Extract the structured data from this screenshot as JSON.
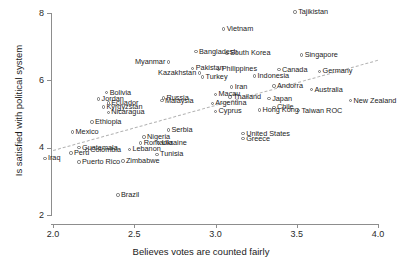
{
  "chart_data": {
    "type": "scatter",
    "title": "",
    "xlabel": "Believes votes are counted fairly",
    "ylabel": "Is satisfied with political system",
    "xlim": [
      2.0,
      4.0
    ],
    "ylim": [
      2.0,
      8.0
    ],
    "xticks": [
      "2.0",
      "2.5",
      "3.0",
      "3.5",
      "4.0"
    ],
    "xtick_values": [
      2.0,
      2.5,
      3.0,
      3.5,
      4.0
    ],
    "yticks": [
      "2",
      "4",
      "6",
      "8"
    ],
    "ytick_values": [
      2,
      4,
      6,
      8
    ],
    "grid": false,
    "legend": "none",
    "fit_line": {
      "style": "dashed",
      "x0": 2.0,
      "y0": 3.92,
      "x1": 4.0,
      "y1": 6.6
    },
    "points": [
      {
        "name": "Tajikistan",
        "x": 3.49,
        "y": 8.03,
        "side": "right"
      },
      {
        "name": "Vietnam",
        "x": 3.05,
        "y": 7.52,
        "side": "right"
      },
      {
        "name": "Bangladesh",
        "x": 2.88,
        "y": 6.85,
        "side": "right"
      },
      {
        "name": "South Korea",
        "x": 3.07,
        "y": 6.8,
        "side": "right"
      },
      {
        "name": "Singapore",
        "x": 3.53,
        "y": 6.75,
        "side": "right"
      },
      {
        "name": "Myanmar",
        "x": 2.71,
        "y": 6.55,
        "side": "left"
      },
      {
        "name": "Pakistan",
        "x": 2.86,
        "y": 6.36,
        "side": "right"
      },
      {
        "name": "Philippines",
        "x": 3.02,
        "y": 6.33,
        "side": "right"
      },
      {
        "name": "Canada",
        "x": 3.39,
        "y": 6.32,
        "side": "right"
      },
      {
        "name": "Germany",
        "x": 3.64,
        "y": 6.27,
        "side": "right"
      },
      {
        "name": "Kazakhstan",
        "x": 2.9,
        "y": 6.22,
        "side": "left"
      },
      {
        "name": "Turkey",
        "x": 2.92,
        "y": 6.1,
        "side": "right"
      },
      {
        "name": "Indonesia",
        "x": 3.24,
        "y": 6.13,
        "side": "right"
      },
      {
        "name": "Andorra",
        "x": 3.36,
        "y": 5.83,
        "side": "right"
      },
      {
        "name": "Iran",
        "x": 3.1,
        "y": 5.8,
        "side": "right"
      },
      {
        "name": "Bolivia",
        "x": 2.33,
        "y": 5.63,
        "side": "right"
      },
      {
        "name": "Macau",
        "x": 3.0,
        "y": 5.58,
        "side": "right"
      },
      {
        "name": "Australia",
        "x": 3.59,
        "y": 5.72,
        "side": "right"
      },
      {
        "name": "Russia",
        "x": 2.68,
        "y": 5.48,
        "side": "right"
      },
      {
        "name": "Thailand",
        "x": 3.09,
        "y": 5.5,
        "side": "right"
      },
      {
        "name": "Jordan",
        "x": 2.28,
        "y": 5.44,
        "side": "right"
      },
      {
        "name": "Japan",
        "x": 3.33,
        "y": 5.46,
        "side": "right"
      },
      {
        "name": "Malaysia",
        "x": 2.67,
        "y": 5.4,
        "side": "right"
      },
      {
        "name": "Ecuador",
        "x": 2.34,
        "y": 5.33,
        "side": "right"
      },
      {
        "name": "New Zealand",
        "x": 3.83,
        "y": 5.4,
        "side": "right"
      },
      {
        "name": "Argentina",
        "x": 2.98,
        "y": 5.32,
        "side": "right"
      },
      {
        "name": "Kyrgyzstan",
        "x": 2.31,
        "y": 5.21,
        "side": "right"
      },
      {
        "name": "Chile",
        "x": 3.36,
        "y": 5.2,
        "side": "right"
      },
      {
        "name": "Nicaragua",
        "x": 2.34,
        "y": 5.05,
        "side": "right"
      },
      {
        "name": "Cyprus",
        "x": 3.0,
        "y": 5.08,
        "side": "right"
      },
      {
        "name": "Hong Kong",
        "x": 3.27,
        "y": 5.12,
        "side": "right"
      },
      {
        "name": "Taiwan ROC",
        "x": 3.51,
        "y": 5.1,
        "side": "right"
      },
      {
        "name": "Ethiopia",
        "x": 2.24,
        "y": 4.76,
        "side": "right"
      },
      {
        "name": "Serbia",
        "x": 2.71,
        "y": 4.52,
        "side": "right"
      },
      {
        "name": "Mexico",
        "x": 2.12,
        "y": 4.47,
        "side": "right"
      },
      {
        "name": "United States",
        "x": 3.17,
        "y": 4.42,
        "side": "right"
      },
      {
        "name": "Nigeria",
        "x": 2.56,
        "y": 4.32,
        "side": "right"
      },
      {
        "name": "Greece",
        "x": 3.17,
        "y": 4.27,
        "side": "right"
      },
      {
        "name": "Romania",
        "x": 2.54,
        "y": 4.14,
        "side": "right"
      },
      {
        "name": "Ukraine",
        "x": 2.65,
        "y": 4.14,
        "side": "right"
      },
      {
        "name": "Guatemala",
        "x": 2.16,
        "y": 4.0,
        "side": "right"
      },
      {
        "name": "Colombia",
        "x": 2.21,
        "y": 3.93,
        "side": "right"
      },
      {
        "name": "Lebanon",
        "x": 2.47,
        "y": 3.95,
        "side": "right"
      },
      {
        "name": "Peru",
        "x": 2.11,
        "y": 3.84,
        "side": "right"
      },
      {
        "name": "Tunisia",
        "x": 2.64,
        "y": 3.8,
        "side": "right"
      },
      {
        "name": "Iraq",
        "x": 1.95,
        "y": 3.68,
        "side": "right"
      },
      {
        "name": "Puerto Rico",
        "x": 2.16,
        "y": 3.58,
        "side": "right"
      },
      {
        "name": "Zimbabwe",
        "x": 2.43,
        "y": 3.6,
        "side": "right"
      },
      {
        "name": "Brazil",
        "x": 2.4,
        "y": 2.59,
        "side": "right"
      }
    ]
  }
}
